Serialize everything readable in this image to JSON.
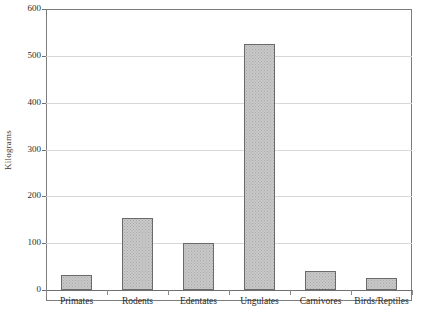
{
  "chart_data": {
    "type": "bar",
    "title": "",
    "xlabel": "",
    "ylabel": "Kilograms",
    "categories": [
      "Primates",
      "Rodents",
      "Edentates",
      "Ungulates",
      "Carnivores",
      "Birds/Reptiles"
    ],
    "values": [
      33,
      154,
      100,
      525,
      40,
      25
    ],
    "ylim": [
      0,
      600
    ],
    "ytick_labels": [
      "0",
      "100",
      "200",
      "300",
      "400",
      "500",
      "600"
    ],
    "ytick_values": [
      0,
      100,
      200,
      300,
      400,
      500,
      600
    ],
    "grid": true,
    "legend": false,
    "series": [
      {
        "name": "Kilograms",
        "values": [
          33,
          154,
          100,
          525,
          40,
          25
        ]
      }
    ]
  },
  "style": {
    "bar_fill": "#c9c9c9",
    "bar_border": "#6a6a6a",
    "gridline_color": "#d8d8d8",
    "axis_color": "#7d7d7d",
    "background": "#ffffff",
    "text_color": "#2b2b2b"
  }
}
